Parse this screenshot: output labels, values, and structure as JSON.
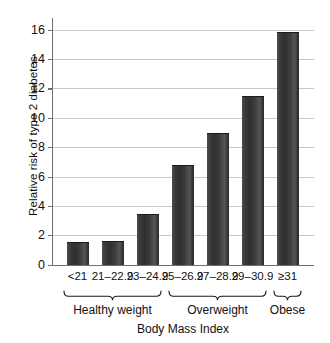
{
  "chart_data": {
    "type": "bar",
    "title": "",
    "xlabel": "Body Mass Index",
    "ylabel": "Relative risk of type 2 diabetes",
    "categories": [
      "<21",
      "21–22.9",
      "23–24.9",
      "25–26.9",
      "27–28.9",
      "29–30.9",
      "≥31"
    ],
    "values": [
      1.5,
      1.55,
      3.4,
      6.7,
      8.9,
      11.4,
      15.8
    ],
    "ylim": [
      0,
      16.8
    ],
    "yticks": [
      0,
      2,
      4,
      6,
      8,
      10,
      12,
      14,
      16
    ],
    "ytick_labels": [
      "0",
      "2",
      "4",
      "6",
      "8",
      "10",
      "12",
      "14",
      "16"
    ],
    "grid": true,
    "legend": false,
    "bar_color": "#3a3a3a",
    "grid_color": "#c9c9c9",
    "axis_color": "#6f6f6f",
    "groups": [
      {
        "label": "Healthy weight",
        "start_index": 0,
        "end_index": 2
      },
      {
        "label": "Overweight",
        "start_index": 3,
        "end_index": 5
      },
      {
        "label": "Obese",
        "start_index": 6,
        "end_index": 6
      }
    ]
  }
}
